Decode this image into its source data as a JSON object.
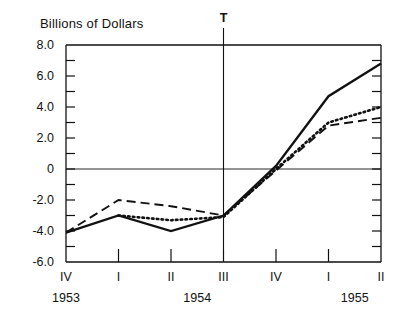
{
  "chart_data": {
    "type": "line",
    "title": "Billions of Dollars",
    "xlabel": "",
    "ylabel": "Billions of Dollars",
    "ylim": [
      -6.0,
      8.0
    ],
    "ytick_step": 1.0,
    "ytick_labels": [
      "8.0",
      "6.0",
      "4.0",
      "2.0",
      "0",
      "-2.0",
      "-4.0",
      "-6.0"
    ],
    "ytick_values": [
      8.0,
      6.0,
      4.0,
      2.0,
      0,
      -2.0,
      -4.0,
      -6.0
    ],
    "grid": false,
    "zero_line": true,
    "categories": [
      "IV",
      "I",
      "II",
      "III",
      "IV",
      "I",
      "II"
    ],
    "year_groups": [
      {
        "label": "1953",
        "center_index": 0
      },
      {
        "label": "1954",
        "center_index": 2.5
      },
      {
        "label": "1955",
        "center_index": 5.5
      }
    ],
    "annotations": [
      {
        "text": "T",
        "at_index": 3,
        "type": "vertical-marker"
      }
    ],
    "legend_position": "none",
    "series": [
      {
        "name": "solid",
        "style": "solid",
        "color": "#111111",
        "values": [
          -4.1,
          -3.0,
          -4.0,
          -3.0,
          0.2,
          4.7,
          6.8
        ]
      },
      {
        "name": "dashed",
        "style": "dashed",
        "color": "#111111",
        "values": [
          -4.1,
          -2.0,
          -2.4,
          -3.0,
          -0.1,
          2.8,
          3.3
        ]
      },
      {
        "name": "dotted",
        "style": "dotted",
        "color": "#111111",
        "values": [
          null,
          -3.0,
          -3.3,
          -3.1,
          0.0,
          3.0,
          4.0
        ]
      }
    ]
  }
}
